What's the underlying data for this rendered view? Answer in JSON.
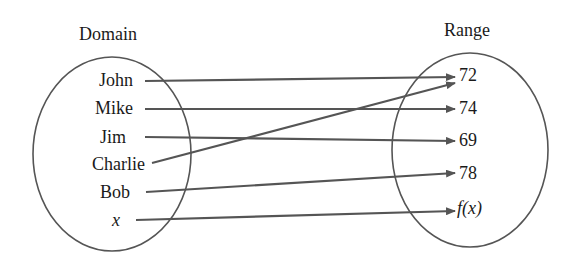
{
  "diagram": {
    "type": "mapping",
    "domain": {
      "title": "Domain",
      "items": [
        "John",
        "Mike",
        "Jim",
        "Charlie",
        "Bob",
        "x"
      ]
    },
    "range": {
      "title": "Range",
      "items": [
        "72",
        "74",
        "69",
        "78",
        "f(x)"
      ]
    },
    "mappings": [
      {
        "from": "John",
        "to": "72"
      },
      {
        "from": "Mike",
        "to": "74"
      },
      {
        "from": "Jim",
        "to": "69"
      },
      {
        "from": "Charlie",
        "to": "72"
      },
      {
        "from": "Bob",
        "to": "78"
      },
      {
        "from": "x",
        "to": "f(x)"
      }
    ],
    "colors": {
      "line": "#555555",
      "text": "#1a1a1a",
      "background": "#ffffff"
    }
  }
}
